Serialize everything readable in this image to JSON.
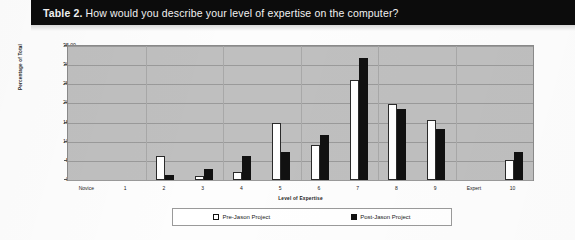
{
  "caption": {
    "label": "Table 2.",
    "text": " How would you describe your level of expertise on the computer?"
  },
  "legend": {
    "pre_label": "Pre-Jason Project",
    "post_label": "Post-Jason Project",
    "pre_swatch": "hollow-square-marker",
    "post_swatch": "filled-square-marker"
  },
  "colors": {
    "caption_background": "#0c0c0c",
    "caption_text": "#f2f2f2",
    "plot_background": "#bfbfbf",
    "gridline": "#9a9a9a",
    "pre_series": "#ffffff",
    "post_series": "#111111",
    "page_background": "#fdfdfd"
  },
  "chart_data": {
    "type": "bar",
    "title": "How would you describe your level of expertise on the computer?",
    "xlabel": "Level of Expertise",
    "ylabel": "Percentage of Total",
    "ylim": [
      0,
      35
    ],
    "ytick_step": 5,
    "ytick_labels": [
      "0.00",
      "5.00",
      "10.00",
      "15.00",
      "20.00",
      "25.00",
      "30.00",
      "35.00"
    ],
    "grid": true,
    "legend_position": "bottom",
    "categories": [
      "Novice",
      "1",
      "2",
      "3",
      "4",
      "5",
      "6",
      "7",
      "8",
      "9",
      "Expert",
      "10"
    ],
    "series": [
      {
        "name": "Pre-Jason Project",
        "color": "#ffffff",
        "values": [
          0.0,
          0.0,
          6.2,
          1.0,
          2.1,
          14.8,
          9.2,
          26.0,
          19.8,
          15.8,
          0.0,
          5.2
        ]
      },
      {
        "name": "Post-Jason Project",
        "color": "#111111",
        "values": [
          0.0,
          0.0,
          1.2,
          2.8,
          6.3,
          7.3,
          11.8,
          31.8,
          18.5,
          13.3,
          0.0,
          7.2
        ]
      }
    ]
  }
}
